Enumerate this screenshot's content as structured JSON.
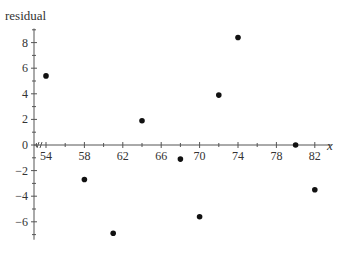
{
  "chart_data": {
    "type": "scatter",
    "title": "",
    "xlabel": "x",
    "ylabel": "residual",
    "xlim": [
      52,
      84
    ],
    "ylim": [
      -7.4,
      9.1
    ],
    "x_axis_break": true,
    "grid": false,
    "legend": null,
    "x_ticks": [
      54,
      58,
      62,
      66,
      70,
      74,
      78,
      82
    ],
    "x_tick_labels": [
      "54",
      "58",
      "62",
      "66",
      "70",
      "74",
      "78",
      "82"
    ],
    "x_minor_ticks": [
      56,
      60,
      64,
      68,
      72,
      76,
      80
    ],
    "y_ticks": [
      -6,
      -4,
      -2,
      0,
      2,
      4,
      6,
      8
    ],
    "y_tick_labels": [
      "−6",
      "−4",
      "−2",
      "0",
      "2",
      "4",
      "6",
      "8"
    ],
    "y_minor_ticks": [
      -7,
      -5,
      -3,
      -1,
      1,
      3,
      5,
      7,
      9
    ],
    "series": [
      {
        "name": "residuals",
        "x": [
          54,
          58,
          61,
          64,
          68,
          70,
          72,
          74,
          80,
          82
        ],
        "y": [
          5.4,
          -2.7,
          -6.9,
          1.9,
          -1.1,
          -5.6,
          3.9,
          8.4,
          0.0,
          -3.5
        ]
      }
    ]
  }
}
